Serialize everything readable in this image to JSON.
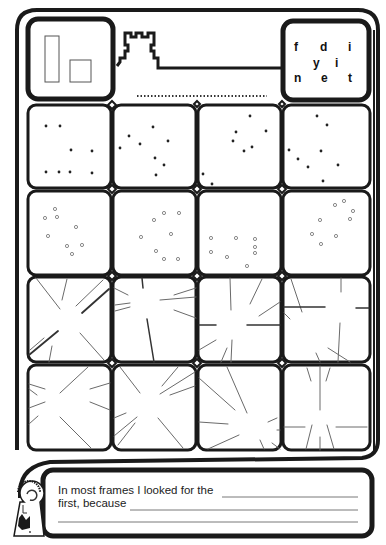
{
  "worksheet": {
    "header": {
      "shapes_panel": {
        "icons": [
          "tall-rectangle",
          "small-square"
        ]
      },
      "castle_icon": "castle-tower",
      "answer_line": "dotted",
      "letter_panel": {
        "rows": [
          [
            "f",
            "d",
            "i"
          ],
          [
            "y",
            "i"
          ],
          [
            "n",
            "e",
            "t"
          ]
        ]
      }
    },
    "grid": {
      "rows": 4,
      "cols": 4,
      "row_types": [
        "star-dots",
        "grey-dots",
        "radiating-lines",
        "radiating-lines"
      ]
    },
    "caption": {
      "line1": "In most frames I looked for the",
      "line2": "first, because"
    },
    "logo": "keyhole-logo",
    "colors": {
      "ink": "#1a1a1a",
      "dot_grey": "#8a8a8a",
      "line_grey": "#6a6a6a",
      "paper": "#ffffff"
    }
  }
}
